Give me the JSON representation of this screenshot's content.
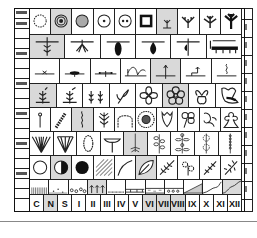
{
  "diagram": {
    "type": "botanical-symbol-chart",
    "rows": [
      {
        "name": "root-and-bud-forms",
        "cells": [
          "dotted-circle",
          "concentric-circles",
          "stippled-circle",
          "circle-dot",
          "circle-two-dots",
          "thick-square",
          "small-seedling",
          "forked-seedling",
          "branching-seedling",
          "large-branched-plant"
        ],
        "shaded": [
          1,
          6
        ]
      },
      {
        "name": "below-ground-forms",
        "cells": [
          "rooted-stem-spikes",
          "bulb-tuft",
          "dark-tuber",
          "dark-bulb",
          "bulb-with-root",
          "rhizome-with-roots"
        ],
        "shaded": [
          0
        ]
      },
      {
        "name": "growth-habits",
        "cells": [
          "small-rosette",
          "flat-rosette",
          "spreading-rosette",
          "arching-runner",
          "upright-shoot",
          "bent-stolon",
          "twining-climber"
        ],
        "shaded": [
          4
        ]
      },
      {
        "name": "shoots-and-flowers",
        "cells": [
          "shoot-with-bud",
          "branched-shoot",
          "paired-shoots",
          "tulip-flower",
          "four-petal-flower",
          "five-petal-flower",
          "violet-flower",
          "irregular-flower"
        ],
        "shaded": [
          0,
          5
        ]
      },
      {
        "name": "inflorescences",
        "cells": [
          "single-spike",
          "catkin",
          "spiral-spike",
          "branched-raceme",
          "arching-panicle",
          "composite-daisy",
          "bell-flower",
          "clover-flower",
          "orchid-flower",
          "pea-flower"
        ],
        "shaded": [
          2
        ]
      },
      {
        "name": "umbels-and-leaves",
        "cells": [
          "compound-umbel",
          "simple-umbel",
          "capitulum-oval",
          "flat-umbel",
          "rosette-stem",
          "opposite-leaves",
          "whorled-leaves",
          "starry-flowers",
          "bead-spike"
        ],
        "shaded": [
          4
        ]
      },
      {
        "name": "light-and-leaf-types",
        "cells": [
          "open-circle",
          "half-circle",
          "filled-circle",
          "hatched-square",
          "narrow-leaf",
          "ovate-leaf",
          "pinnate-leaf",
          "flowered-branch",
          "fern-frond",
          "feathery-leaf"
        ],
        "shaded": [
          1,
          5
        ]
      },
      {
        "name": "soil-types",
        "cells": [
          "vertical-hatch",
          "sparse-dots",
          "gravel",
          "seedlings",
          "fine-line",
          "bricks",
          "sand-layer",
          "pebble-layer",
          "dotted-slope",
          "rising-slope",
          "steep-slope"
        ],
        "shaded": [
          3
        ]
      },
      {
        "name": "column-labels",
        "cells": [
          "C",
          "N",
          "S",
          "I",
          "II",
          "III",
          "IV",
          "V",
          "VI",
          "VII",
          "VIII",
          "IX",
          "X",
          "XI",
          "XII"
        ],
        "shaded": [
          1,
          8,
          9,
          10
        ]
      }
    ]
  },
  "labels": {
    "bottom": [
      "C",
      "N",
      "S",
      "I",
      "II",
      "III",
      "IV",
      "V",
      "VI",
      "VII",
      "VIII",
      "IX",
      "X",
      "XI",
      "XII"
    ]
  }
}
